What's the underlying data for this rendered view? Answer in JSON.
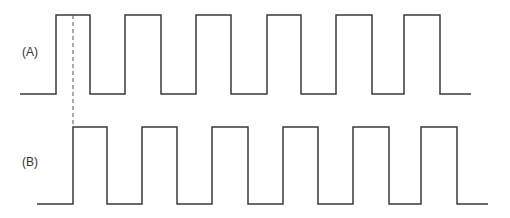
{
  "diagram": {
    "type": "timing-diagram",
    "colors": {
      "wave": "#3a3a3a",
      "marker": "#555555",
      "background": "#ffffff"
    },
    "signals": [
      {
        "label": "(A)",
        "high_y": 15,
        "low_y": 94,
        "start_x": 20,
        "end_x": 471,
        "rising_edges": [
          56,
          125,
          196,
          267,
          336,
          404
        ],
        "falling_edges": [
          90,
          161,
          231,
          301,
          372,
          440
        ]
      },
      {
        "label": "(B)",
        "high_y": 127,
        "low_y": 204,
        "start_x": 37,
        "end_x": 488,
        "rising_edges": [
          73,
          142,
          212,
          283,
          353,
          421
        ],
        "falling_edges": [
          107,
          177,
          248,
          318,
          389,
          457
        ]
      }
    ],
    "marker_line": {
      "style": "dashed",
      "x": 73,
      "y1": 15,
      "y2": 127
    }
  }
}
